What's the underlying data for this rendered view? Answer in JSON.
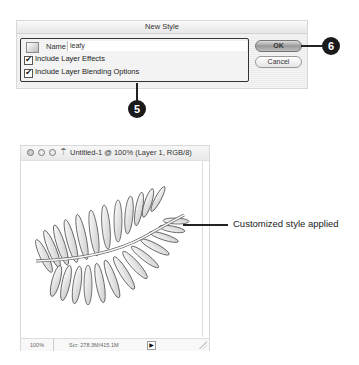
{
  "dialog": {
    "title": "New Style",
    "name_label": "Name",
    "name_value": "leafy",
    "include_layer_effects": {
      "label": "Include Layer Effects",
      "checked": true,
      "mark": "✔"
    },
    "include_blending_options": {
      "label": "Include Layer Blending Options",
      "checked": true,
      "mark": "✔"
    },
    "ok_label": "OK",
    "cancel_label": "Cancel",
    "style_preview_icon": "style-swatch-icon"
  },
  "callouts": {
    "step5": "5",
    "step6": "6"
  },
  "document_window": {
    "title": "Untitled-1 @ 100% (Layer 1, RGB/8)",
    "doc_icon": "⍑",
    "zoom_level": "100%",
    "scratch_sizes": "Scr: 278.3M/415.1M",
    "status_menu_arrow": "▶",
    "canvas_content": "leaf-frond-image"
  },
  "annotation": {
    "text": "Customized style applied"
  },
  "colors": {
    "callout_fill": "#1a1a1a",
    "dialog_bg": "#f2f2f2",
    "ok_button": "#9a9a9a"
  }
}
